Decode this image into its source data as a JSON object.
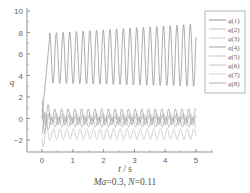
{
  "chart_data": {
    "type": "line",
    "title": "",
    "caption": {
      "ma_label": "Ma",
      "ma_value": "=0.3, ",
      "n_label": "N",
      "n_value": "=0.11"
    },
    "xlabel": {
      "var": "t",
      "unit": " / s"
    },
    "ylabel": "q",
    "xlim": [
      -0.6,
      5.6
    ],
    "ylim": [
      -3,
      10
    ],
    "xticks": [
      0,
      1,
      2,
      3,
      4,
      5
    ],
    "yticks": [
      -2,
      0,
      2,
      4,
      6,
      8,
      10
    ],
    "grid": false,
    "legend_position": "upper right (outside plot area)",
    "series": [
      {
        "name": "q(1)",
        "color": "#8a8a8a",
        "description": "rises from 0 at t≈0 to oscillation between ~3.3 and ~7.8, peaks growing to ~8.4 by t=5",
        "mean": 5.6,
        "amp": 2.3,
        "freq": 4.6
      },
      {
        "name": "q(2)",
        "color": "#b8b8b8",
        "description": "small oscillation around 0",
        "mean": 0.1,
        "amp": 0.35,
        "freq": 4.6
      },
      {
        "name": "q(3)",
        "color": "#c8c8c8",
        "description": "small oscillation around 0",
        "mean": -0.05,
        "amp": 0.3,
        "freq": 4.6
      },
      {
        "name": "q(4)",
        "color": "#9a9a9a",
        "description": "oscillation between ~ -0.6 and ~0.9",
        "mean": 0.15,
        "amp": 0.75,
        "freq": 4.6
      },
      {
        "name": "q(5)",
        "color": "#bdbdbd",
        "description": "small oscillation near 0",
        "mean": 0.0,
        "amp": 0.2,
        "freq": 4.6
      },
      {
        "name": "q(6)",
        "color": "#c0c0c0",
        "description": "oscillation between ~ -2.0 and ~ -0.9",
        "mean": -1.45,
        "amp": 0.5,
        "freq": 4.6
      },
      {
        "name": "q(7)",
        "color": "#d0d0d0",
        "description": "small oscillation around -0.2",
        "mean": -0.2,
        "amp": 0.25,
        "freq": 4.6
      },
      {
        "name": "q(8)",
        "color": "#a8a8a8",
        "description": "oscillation around -0.4",
        "mean": -0.35,
        "amp": 0.45,
        "freq": 4.6
      }
    ],
    "t_range": [
      0,
      5
    ]
  },
  "legend": {
    "items": [
      "q(1)",
      "q(2)",
      "q(3)",
      "q(4)",
      "q(5)",
      "q(6)",
      "q(7)",
      "q(8)"
    ]
  }
}
